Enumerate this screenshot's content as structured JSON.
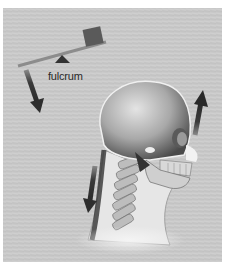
{
  "figure": {
    "lever": {
      "label": "fulcrum",
      "colors": {
        "lever": "#8a8a8a",
        "weight": "#5a5a5a",
        "fulcrum": "#3a3a3a"
      }
    },
    "arrows": [
      {
        "name": "lever-down-arrow",
        "direction": "down"
      },
      {
        "name": "face-up-arrow",
        "direction": "up"
      },
      {
        "name": "neck-down-arrow",
        "direction": "down"
      }
    ],
    "colors": {
      "background": "#c9c9c9",
      "arrow": "#3c3c3c",
      "border": "#ffffff"
    }
  }
}
